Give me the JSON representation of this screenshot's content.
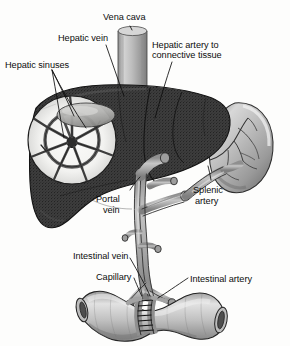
{
  "figure": {
    "background_color": "#fdfdfc",
    "ink_color": "#0d0d0d"
  },
  "labels": [
    {
      "id": "vena-cava",
      "text": "Vena cava",
      "x": 103,
      "y": 12,
      "align": "left"
    },
    {
      "id": "hepatic-vein",
      "text": "Hepatic vein",
      "x": 58,
      "y": 33,
      "align": "left"
    },
    {
      "id": "hepatic-artery",
      "text": "Hepatic artery to",
      "x": 152,
      "y": 40,
      "align": "left"
    },
    {
      "id": "hepatic-artery-2",
      "text": "connective tissue",
      "x": 152,
      "y": 50,
      "align": "left"
    },
    {
      "id": "hepatic-sinuses",
      "text": "Hepatic sinuses",
      "x": 5,
      "y": 60,
      "align": "left"
    },
    {
      "id": "portal-vein",
      "text": "Portal",
      "x": 96,
      "y": 194,
      "align": "left"
    },
    {
      "id": "portal-vein-2",
      "text": "vein",
      "x": 103,
      "y": 205,
      "align": "left"
    },
    {
      "id": "splenic-artery",
      "text": "Splenic",
      "x": 193,
      "y": 185,
      "align": "left"
    },
    {
      "id": "splenic-artery-2",
      "text": "artery",
      "x": 195,
      "y": 196,
      "align": "left"
    },
    {
      "id": "intestinal-vein",
      "text": "Intestinal vein",
      "x": 73,
      "y": 251,
      "align": "left"
    },
    {
      "id": "capillary",
      "text": "Capillary",
      "x": 96,
      "y": 272,
      "align": "left"
    },
    {
      "id": "intestinal-artery",
      "text": "Intestinal artery",
      "x": 190,
      "y": 274,
      "align": "left"
    }
  ],
  "structures": {
    "liver": {
      "name": "liver",
      "fill": "#3a3a3a"
    },
    "spleen": {
      "name": "spleen",
      "fill": "#b9b9b9"
    },
    "vena_cava": {
      "name": "vena-cava-vessel",
      "fill": "#b0b0b0"
    },
    "portal_vein": {
      "name": "portal-vein-vessel",
      "fill": "#a8a8a8"
    },
    "splenic_artery": {
      "name": "splenic-artery-vessel",
      "fill": "#a8a8a8"
    },
    "intestine": {
      "name": "intestine-tube",
      "fill": "#c4c4c4"
    },
    "sinusoid_inset": {
      "name": "hepatic-sinusoid-inset",
      "fill": "#f4f4f2"
    },
    "capillary_band": {
      "name": "capillary-band",
      "fill": "#9a9a9a"
    }
  }
}
